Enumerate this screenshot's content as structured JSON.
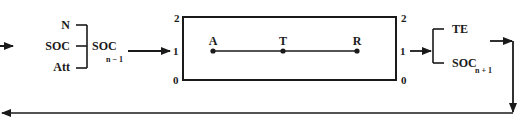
{
  "diagram": {
    "inputs": {
      "labels": [
        "N",
        "SOC",
        "Att"
      ],
      "combined_label": "SOC",
      "combined_subscript": "n − 1"
    },
    "state_box": {
      "left_ticks": [
        "2",
        "1",
        "0"
      ],
      "right_ticks": [
        "2",
        "1",
        "0"
      ],
      "points": [
        "A",
        "T",
        "R"
      ]
    },
    "outputs": {
      "labels": [
        "TE",
        "SOC"
      ],
      "soc_subscript": "n + 1"
    },
    "colors": {
      "line": "#1a1a1a",
      "background": "#ffffff"
    }
  }
}
